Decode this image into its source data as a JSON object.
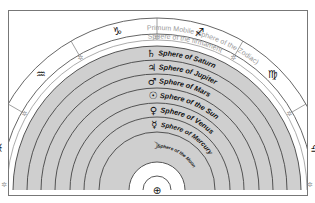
{
  "outer_sphere": {
    "label": "Primum Mobile (sphere of the Zodiac)"
  },
  "firmament": {
    "label": "Sphere of the firmament"
  },
  "zodiac_signs": [
    {
      "name": "pisces",
      "glyph": "♓"
    },
    {
      "name": "aquarius",
      "glyph": "♒"
    },
    {
      "name": "capricorn",
      "glyph": "♑"
    },
    {
      "name": "sagittarius",
      "glyph": "♐"
    },
    {
      "name": "virgo",
      "glyph": "♍"
    },
    {
      "name": "libra",
      "glyph": "♎"
    }
  ],
  "star_symbol": "✲",
  "spheres": [
    {
      "name": "saturn",
      "glyph": "♄",
      "label": "Sphere of Saturn"
    },
    {
      "name": "jupiter",
      "glyph": "♃",
      "label": "Sphere of Jupiter"
    },
    {
      "name": "mars",
      "glyph": "♂",
      "label": "Sphere of Mars"
    },
    {
      "name": "sun",
      "glyph": "☉",
      "label": "Sphere of the Sun"
    },
    {
      "name": "venus",
      "glyph": "♀",
      "label": "Sphere of Venus"
    },
    {
      "name": "mercury",
      "glyph": "☿",
      "label": "Sphere of Mercury"
    },
    {
      "name": "moon",
      "glyph": "☽",
      "label": "Sphere of the Moon"
    }
  ],
  "earth": {
    "glyph": "⊕"
  },
  "colors": {
    "sphere_fill": "#cfcfcf",
    "line": "#444444",
    "light_text": "#999999",
    "background": "#ffffff"
  }
}
